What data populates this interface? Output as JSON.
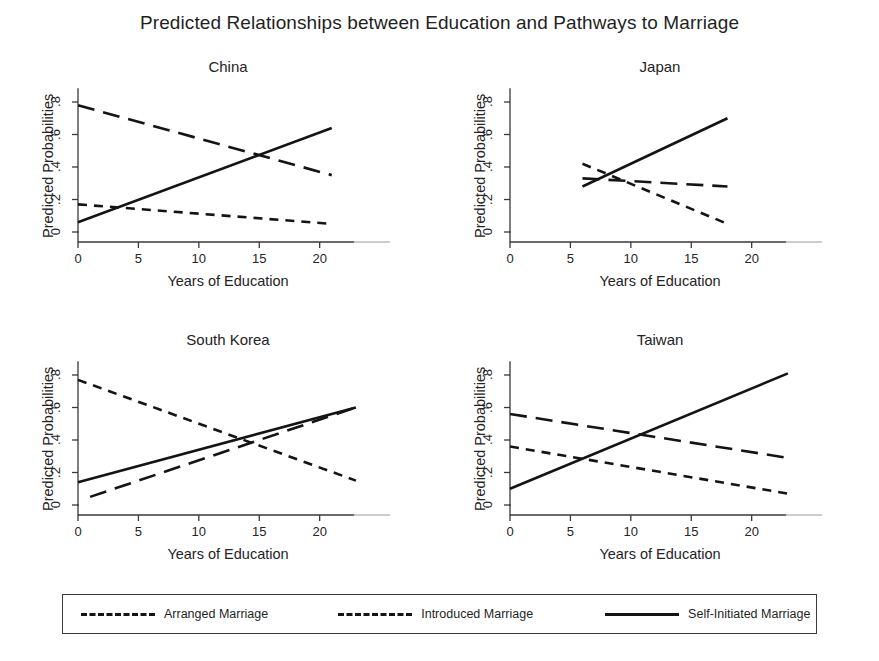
{
  "figure": {
    "title": "Predicted Relationships between Education and Pathways to Marriage",
    "y_axis_label": "Predicted Probabilities",
    "x_axis_label": "Years of Education"
  },
  "legend": {
    "position": "bottom",
    "items": [
      {
        "label": "Arranged Marriage",
        "style": "short-dash",
        "key": "arranged"
      },
      {
        "label": "Introduced Marriage",
        "style": "long-dash",
        "key": "introduced"
      },
      {
        "label": "Self-Initiated Marriage",
        "style": "solid",
        "key": "self_initiated"
      }
    ]
  },
  "chart_data": [
    {
      "type": "line",
      "title": "China",
      "xlabel": "Years of Education",
      "ylabel": "Predicted Probabilities",
      "xlim": [
        0,
        24
      ],
      "ylim": [
        0,
        0.88
      ],
      "xticks": [
        0,
        5,
        10,
        15,
        20
      ],
      "yticks": [
        0,
        0.2,
        0.4,
        0.6,
        0.8
      ],
      "ytick_labels": [
        "0",
        ".2",
        ".4",
        ".6",
        ".8"
      ],
      "xtick_labels": [
        "0",
        "5",
        "10",
        "15",
        "20"
      ],
      "grid": false,
      "series": [
        {
          "name": "Arranged Marriage",
          "style": "short-dash",
          "x": [
            0,
            21
          ],
          "y": [
            0.17,
            0.05
          ]
        },
        {
          "name": "Introduced Marriage",
          "style": "long-dash",
          "x": [
            0,
            21
          ],
          "y": [
            0.78,
            0.35
          ]
        },
        {
          "name": "Self-Initiated Marriage",
          "style": "solid",
          "x": [
            0,
            21
          ],
          "y": [
            0.06,
            0.64
          ]
        }
      ]
    },
    {
      "type": "line",
      "title": "Japan",
      "xlabel": "Years of Education",
      "ylabel": "Predicted Probabilities",
      "xlim": [
        0,
        24
      ],
      "ylim": [
        0,
        0.88
      ],
      "xticks": [
        0,
        5,
        10,
        15,
        20
      ],
      "yticks": [
        0,
        0.2,
        0.4,
        0.6,
        0.8
      ],
      "ytick_labels": [
        "0",
        ".2",
        ".4",
        ".6",
        ".8"
      ],
      "xtick_labels": [
        "0",
        "5",
        "10",
        "15",
        "20"
      ],
      "grid": false,
      "series": [
        {
          "name": "Arranged Marriage",
          "style": "short-dash",
          "x": [
            6,
            18
          ],
          "y": [
            0.42,
            0.05
          ]
        },
        {
          "name": "Introduced Marriage",
          "style": "long-dash",
          "x": [
            6,
            18
          ],
          "y": [
            0.33,
            0.28
          ]
        },
        {
          "name": "Self-Initiated Marriage",
          "style": "solid",
          "x": [
            6,
            18
          ],
          "y": [
            0.28,
            0.7
          ]
        }
      ]
    },
    {
      "type": "line",
      "title": "South Korea",
      "xlabel": "Years of Education",
      "ylabel": "Predicted Probabilities",
      "xlim": [
        0,
        24
      ],
      "ylim": [
        0,
        0.88
      ],
      "xticks": [
        0,
        5,
        10,
        15,
        20
      ],
      "yticks": [
        0,
        0.2,
        0.4,
        0.6,
        0.8
      ],
      "ytick_labels": [
        "0",
        ".2",
        ".4",
        ".6",
        ".8"
      ],
      "xtick_labels": [
        "0",
        "5",
        "10",
        "15",
        "20"
      ],
      "grid": false,
      "series": [
        {
          "name": "Arranged Marriage",
          "style": "short-dash",
          "x": [
            0,
            23
          ],
          "y": [
            0.77,
            0.15
          ]
        },
        {
          "name": "Introduced Marriage",
          "style": "long-dash",
          "x": [
            1,
            23
          ],
          "y": [
            0.05,
            0.6
          ]
        },
        {
          "name": "Self-Initiated Marriage",
          "style": "solid",
          "x": [
            0,
            23
          ],
          "y": [
            0.14,
            0.6
          ]
        }
      ]
    },
    {
      "type": "line",
      "title": "Taiwan",
      "xlabel": "Years of Education",
      "ylabel": "Predicted Probabilities",
      "xlim": [
        0,
        24
      ],
      "ylim": [
        0,
        0.88
      ],
      "xticks": [
        0,
        5,
        10,
        15,
        20
      ],
      "yticks": [
        0,
        0.2,
        0.4,
        0.6,
        0.8
      ],
      "ytick_labels": [
        "0",
        ".2",
        ".4",
        ".6",
        ".8"
      ],
      "xtick_labels": [
        "0",
        "5",
        "10",
        "15",
        "20"
      ],
      "grid": false,
      "series": [
        {
          "name": "Arranged Marriage",
          "style": "short-dash",
          "x": [
            0,
            23
          ],
          "y": [
            0.36,
            0.07
          ]
        },
        {
          "name": "Introduced Marriage",
          "style": "long-dash",
          "x": [
            0,
            23
          ],
          "y": [
            0.56,
            0.29
          ]
        },
        {
          "name": "Self-Initiated Marriage",
          "style": "solid",
          "x": [
            0,
            23
          ],
          "y": [
            0.1,
            0.81
          ]
        }
      ]
    }
  ],
  "colors": {
    "line": "#141414",
    "axis": "#3a3a3a",
    "text": "#1f1f1f",
    "background": "#ffffff"
  }
}
